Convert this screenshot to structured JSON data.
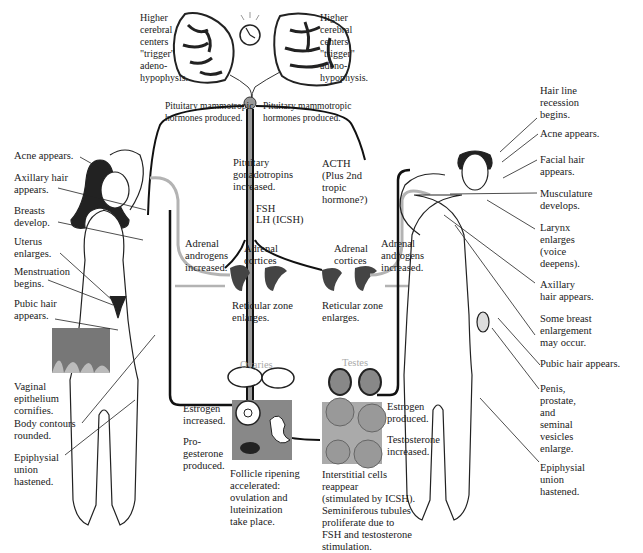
{
  "colors": {
    "line_dark": "#111111",
    "line_gray": "#b3b3b3",
    "skin": "#ffffff",
    "hair": "#1a1a1a",
    "organ": "#777777"
  },
  "brain": {
    "left_label": "Higher\ncerebral\ncenters\n\"trigger\"\nadeno-\nhypophysis.",
    "right_label": "Higher\ncerebral\ncenters\n\"trigger\"\nadeno-\nhypophysis.",
    "clock_icon": "alarm-clock"
  },
  "pituitary": {
    "left_label": "Pituitary mammotropic\nhormones produced.",
    "right_label": "Pituitary mammotropic\nhormones produced.",
    "gonadotropins": "Pituitary\ngonadotropins\nincreased.",
    "fsh": "FSH",
    "lh": "LH (ICSH)",
    "acth": "ACTH\n(Plus 2nd\ntropic\nhormone?)"
  },
  "adrenal": {
    "left_androgens": "Adrenal\nandrogens\nincreased.",
    "left_cortices": "Adrenal\ncortices",
    "right_cortices": "Adrenal\ncortices",
    "right_androgens": "Adrenal\nandrogens\nincreased.",
    "left_reticular": "Reticular zone\nenlarges.",
    "right_reticular": "Reticular zone\nenlarges."
  },
  "female": {
    "labels": [
      "Acne appears.",
      "Axillary hair\nappears.",
      "Breasts\ndevelop.",
      "Uterus\nenlarges.",
      "Menstruation\nbegins.",
      "Pubic hair\nappears.",
      "Vaginal\nepithelium\ncornifies.",
      "Body contours\nrounded.",
      "Epiphysial\nunion\nhastened."
    ],
    "ovaries_title": "Ovaries",
    "estrogen": "Estrogen\nincreased.",
    "progesterone": "Pro-\ngesterone\nproduced.",
    "follicle": "Follicle ripening\naccelerated:\novulation and\nluteinization\ntake place."
  },
  "male": {
    "labels": [
      "Hair line\nrecession\nbegins.",
      "Acne appears.",
      "Facial hair\nappears.",
      "Musculature\ndevelops.",
      "Larynx\nenlarges\n(voice\ndeepens).",
      "Axillary\nhair appears.",
      "Some breast\nenlargement\nmay occur.",
      "Pubic hair appears.",
      "Penis,\nprostate,\nand\nseminal\nvesicles\nenlarge.",
      "Epiphysial\nunion\nhastened."
    ],
    "testes_title": "Testes",
    "estrogen": "Estrogen\nproduced.",
    "testosterone": "Testosterone\nincreased.",
    "interstitial": "Interstitial cells\nreappear\n(stimulated by ICSH).\nSeminiferous tubules\nproliferate due to\nFSH and testosterone\nstimulation."
  }
}
